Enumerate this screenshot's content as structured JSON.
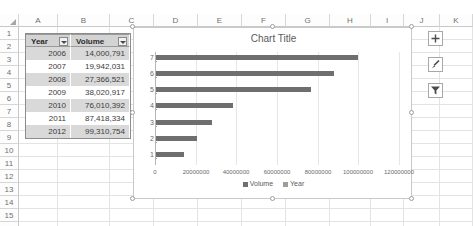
{
  "app": "excel-worksheet",
  "grid": {
    "columns": [
      "A",
      "B",
      "C",
      "D",
      "E",
      "F",
      "G",
      "H",
      "I",
      "J",
      "K"
    ],
    "rows": [
      "1",
      "2",
      "3",
      "4",
      "5",
      "6",
      "7",
      "8",
      "9",
      "10",
      "11",
      "12",
      "13",
      "14",
      "15",
      "16"
    ],
    "select_all_icon": "select-all-triangle-icon"
  },
  "table": {
    "headers": [
      "Year",
      "Volume"
    ],
    "filter_icon": "filter-dropdown-icon",
    "rows": [
      {
        "year": "2006",
        "volume": "14,000,791"
      },
      {
        "year": "2007",
        "volume": "19,942,031"
      },
      {
        "year": "2008",
        "volume": "27,366,521"
      },
      {
        "year": "2009",
        "volume": "38,020,917"
      },
      {
        "year": "2010",
        "volume": "76,010,392"
      },
      {
        "year": "2011",
        "volume": "87,418,334"
      },
      {
        "year": "2012",
        "volume": "99,310,754"
      }
    ]
  },
  "chart_buttons": [
    {
      "name": "chart-elements-button",
      "icon": "plus-icon"
    },
    {
      "name": "chart-styles-button",
      "icon": "brush-icon"
    },
    {
      "name": "chart-filters-button",
      "icon": "funnel-icon"
    }
  ],
  "chart_data": {
    "type": "bar",
    "orientation": "horizontal",
    "title": "Chart Title",
    "xlabel": "",
    "ylabel": "",
    "categories": [
      "1",
      "2",
      "3",
      "4",
      "5",
      "6",
      "7"
    ],
    "xticks": [
      "0",
      "20000000",
      "40000000",
      "60000000",
      "80000000",
      "100000000",
      "120000000"
    ],
    "xlim": [
      0,
      120000000
    ],
    "grid": true,
    "legend_position": "bottom",
    "series": [
      {
        "name": "Volume",
        "color": "#6f6f6f",
        "values": [
          14000791,
          19942031,
          27366521,
          38020917,
          76010392,
          87418334,
          99310754
        ]
      },
      {
        "name": "Year",
        "color": "#9d9d9d",
        "values": [
          2006,
          2007,
          2008,
          2009,
          2010,
          2011,
          2012
        ]
      }
    ]
  }
}
